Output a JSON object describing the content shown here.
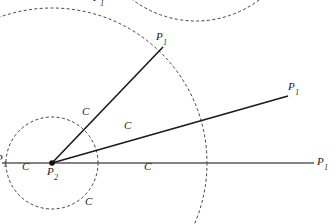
{
  "figure": {
    "type": "geometry-diagram",
    "width": 336,
    "height": 224,
    "background_color": "#ffffff",
    "stroke_color": "#1a1a1a",
    "dashed_stroke_color": "#2b2b2b",
    "baseline_color": "#5a5a5a"
  },
  "points": {
    "vertex": {
      "label_base": "P",
      "label_sub": "2",
      "x": 52,
      "y": 163
    },
    "p1_upper": {
      "label_base": "P",
      "label_sub": "1",
      "x": 163,
      "y": 47
    },
    "p1_middle": {
      "label_base": "P",
      "label_sub": "1",
      "x": 288,
      "y": 96
    },
    "p1_right": {
      "label_base": "P",
      "label_sub": "1",
      "x": 314,
      "y": 163
    },
    "p1_left_edge": {
      "label_base": "P",
      "label_sub": "1",
      "x": 2,
      "y": 160
    },
    "p1_top_edge": {
      "label_base": "P",
      "label_sub": "1",
      "x": 96,
      "y": 2
    }
  },
  "intersection_labels": [
    {
      "text": "C",
      "x": 86,
      "y": 113,
      "note": "upper ray crosses small circle"
    },
    {
      "text": "C",
      "x": 127,
      "y": 127,
      "note": "middle ray crosses small circle"
    },
    {
      "text": "C",
      "x": 26,
      "y": 168,
      "note": "left of vertex on baseline"
    },
    {
      "text": "C",
      "x": 147,
      "y": 168,
      "note": "right of vertex on baseline"
    },
    {
      "text": "C",
      "x": 88,
      "y": 203,
      "note": "below small circle"
    }
  ],
  "circles": {
    "large_dashed": {
      "center_x": 52,
      "center_y": 163,
      "radius": 155,
      "style": "dashed"
    },
    "small_dashed": {
      "center_x": 52,
      "center_y": 163,
      "radius": 46,
      "style": "dashed"
    },
    "top_partial_arc": {
      "center_x": 196,
      "center_y": -84,
      "radius": 105,
      "style": "dashed"
    }
  },
  "rays": [
    {
      "name": "ray-to-p1-upper",
      "x1": 52,
      "y1": 163,
      "x2": 163,
      "y2": 47,
      "weight": 1.6,
      "color": "#1a1a1a"
    },
    {
      "name": "ray-to-p1-middle",
      "x1": 52,
      "y1": 163,
      "x2": 288,
      "y2": 96,
      "weight": 1.6,
      "color": "#1a1a1a"
    },
    {
      "name": "baseline-ray",
      "x1": 2,
      "y1": 163,
      "x2": 314,
      "y2": 163,
      "weight": 1.6,
      "color": "#5a5a5a"
    }
  ]
}
